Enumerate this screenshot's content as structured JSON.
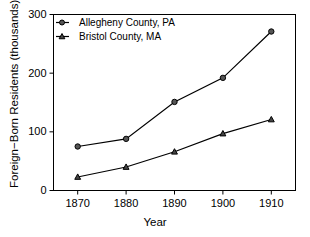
{
  "chart_data": {
    "type": "line",
    "title": "",
    "xlabel": "Year",
    "ylabel": "Foreign−Born Residents (thousands)",
    "x": [
      1870,
      1880,
      1890,
      1900,
      1910
    ],
    "xticklabels": [
      "1870",
      "1880",
      "1890",
      "1900",
      "1910"
    ],
    "yticks": [
      0,
      100,
      200,
      300
    ],
    "yticklabels": [
      "0",
      "100",
      "200",
      "300"
    ],
    "xlim": [
      1865,
      1915
    ],
    "ylim": [
      0,
      300
    ],
    "grid": false,
    "legend_position": "upper-left-inside",
    "series": [
      {
        "name": "Allegheny County, PA",
        "marker": "circle",
        "color": "#000000",
        "values": [
          75,
          88,
          151,
          192,
          271
        ]
      },
      {
        "name": "Bristol County, MA",
        "marker": "triangle",
        "color": "#000000",
        "values": [
          23,
          40,
          66,
          97,
          121
        ]
      }
    ]
  }
}
